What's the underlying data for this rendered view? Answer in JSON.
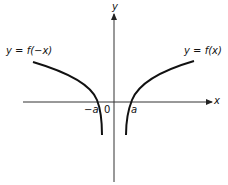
{
  "diagram": {
    "title": "",
    "axes": {
      "x_label": "x",
      "y_label": "y",
      "origin_label": "0"
    },
    "ticks": {
      "neg_a": "−a",
      "pos_a": "a"
    },
    "curves": [
      {
        "name": "f-of-negative-x",
        "label": "y = f(−x)"
      },
      {
        "name": "f-of-x",
        "label": "y = f(x)"
      }
    ],
    "colors": {
      "line": "#111111",
      "axis": "#222222",
      "background": "#ffffff"
    }
  }
}
